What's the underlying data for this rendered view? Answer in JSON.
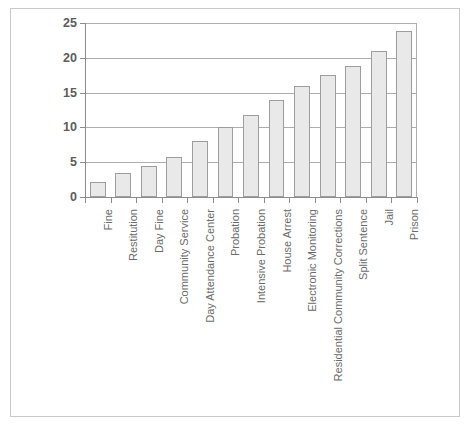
{
  "chart_data": {
    "type": "bar",
    "title": "",
    "subtitle": "",
    "xlabel": "",
    "ylabel": "",
    "ylim": [
      0,
      25
    ],
    "yticks": [
      0,
      5,
      10,
      15,
      20,
      25
    ],
    "grid": true,
    "legend": null,
    "orientation": "vertical",
    "categories": [
      "Fine",
      "Restitution",
      "Day Fine",
      "Community Service",
      "Day Attendance Center",
      "Probation",
      "Intensive Probation",
      "House Arrest",
      "Electronic Monitoring",
      "Residential Community Corrections",
      "Split Sentence",
      "Jail",
      "Prison"
    ],
    "values": [
      2.2,
      3.4,
      4.4,
      5.7,
      8.0,
      10.0,
      11.8,
      14.0,
      16.0,
      17.5,
      18.8,
      21.0,
      23.8
    ],
    "bar_fill": "#e9e9e9",
    "bar_edge": "#9d9d9d",
    "grid_color": "#aeaeae",
    "axis_color": "#8d8d8d",
    "tick_label_color": "#5c5c5c",
    "category_label_color": "#6b6b6b",
    "frame_color": "#c9c9c9",
    "background": "#ffffff"
  }
}
